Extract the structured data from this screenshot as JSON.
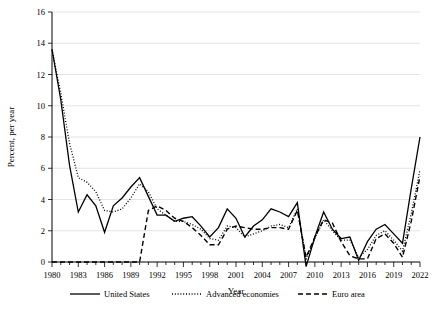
{
  "chart_data": {
    "type": "line",
    "title": "",
    "xlabel": "Year",
    "ylabel": "Percent, per year",
    "ylim": [
      0,
      16
    ],
    "yticks": [
      0,
      2,
      4,
      6,
      8,
      10,
      12,
      14,
      16
    ],
    "xlim": [
      1980,
      2022
    ],
    "xticks": [
      1980,
      1983,
      1986,
      1989,
      1992,
      1995,
      1998,
      2001,
      2004,
      2007,
      2010,
      2013,
      2016,
      2019,
      2022
    ],
    "grid": "horizontal",
    "legend_position": "bottom",
    "x": [
      1980,
      1981,
      1982,
      1983,
      1984,
      1985,
      1986,
      1987,
      1988,
      1989,
      1990,
      1991,
      1992,
      1993,
      1994,
      1995,
      1996,
      1997,
      1998,
      1999,
      2000,
      2001,
      2002,
      2003,
      2004,
      2005,
      2006,
      2007,
      2008,
      2009,
      2010,
      2011,
      2012,
      2013,
      2014,
      2015,
      2016,
      2017,
      2018,
      2019,
      2020,
      2021,
      2022
    ],
    "series": [
      {
        "name": "United States",
        "style": "solid",
        "values": [
          13.6,
          10.4,
          6.2,
          3.2,
          4.3,
          3.6,
          1.9,
          3.6,
          4.1,
          4.8,
          5.4,
          4.2,
          3.0,
          3.0,
          2.6,
          2.8,
          2.9,
          2.3,
          1.6,
          2.2,
          3.4,
          2.8,
          1.6,
          2.3,
          2.7,
          3.4,
          3.2,
          2.9,
          3.8,
          -0.3,
          1.6,
          3.2,
          2.1,
          1.5,
          1.6,
          0.1,
          1.3,
          2.1,
          2.4,
          1.8,
          1.2,
          4.7,
          8.0
        ]
      },
      {
        "name": "Advanced economies",
        "style": "dotted",
        "values": [
          13.6,
          10.8,
          7.6,
          5.4,
          5.1,
          4.5,
          3.3,
          3.2,
          3.4,
          4.1,
          5.0,
          4.5,
          3.4,
          3.0,
          2.6,
          2.6,
          2.4,
          2.1,
          1.5,
          1.4,
          2.3,
          2.2,
          1.6,
          1.8,
          2.0,
          2.3,
          2.4,
          2.2,
          3.4,
          0.2,
          1.5,
          2.7,
          2.0,
          1.4,
          1.4,
          0.3,
          0.8,
          1.7,
          2.0,
          1.4,
          0.7,
          3.1,
          5.9
        ]
      },
      {
        "name": "Euro area",
        "style": "dashed",
        "values": [
          0.0,
          0.0,
          0.0,
          0.0,
          0.0,
          0.0,
          0.0,
          0.0,
          0.0,
          0.0,
          0.0,
          3.3,
          3.6,
          3.3,
          2.8,
          2.6,
          2.2,
          1.7,
          1.1,
          1.1,
          2.1,
          2.3,
          2.2,
          2.1,
          2.1,
          2.2,
          2.2,
          2.1,
          3.3,
          0.3,
          1.6,
          2.7,
          2.5,
          1.3,
          0.4,
          0.2,
          0.2,
          1.5,
          1.8,
          1.2,
          0.3,
          2.6,
          5.5
        ]
      }
    ]
  },
  "legend": {
    "items": [
      {
        "label": "United States",
        "style": "solid"
      },
      {
        "label": "Advanced economies",
        "style": "dotted"
      },
      {
        "label": "Euro area",
        "style": "dashed"
      }
    ]
  }
}
